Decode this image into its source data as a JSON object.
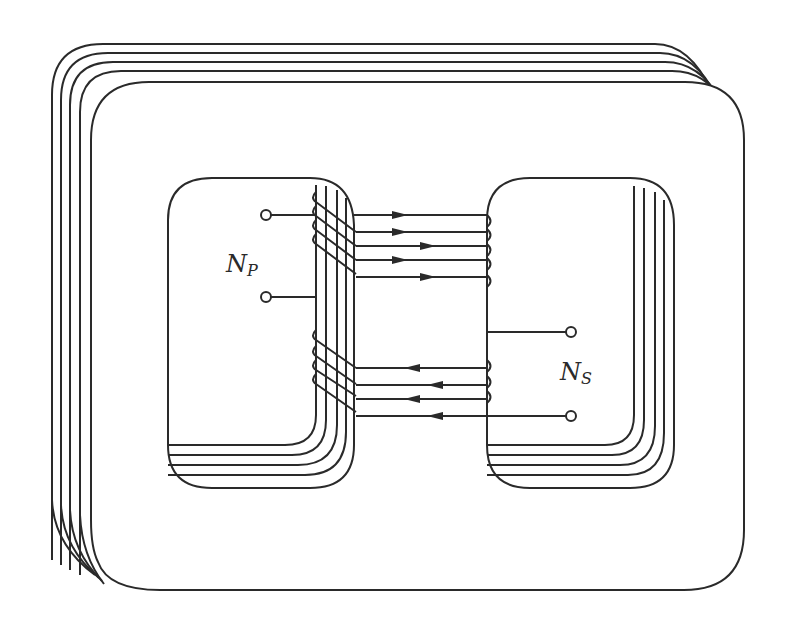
{
  "figure": {
    "type": "transformer-core-diagram",
    "stroke_color": "#2a2a2a",
    "background_color": "#ffffff"
  },
  "core": {
    "lamination_count": 5
  },
  "primary": {
    "label_main": "N",
    "label_sub": "P",
    "terminal_count": 2
  },
  "secondary": {
    "label_main": "N",
    "label_sub": "S",
    "terminal_count": 2
  },
  "flux_arrows": {
    "upper_direction": "right",
    "lower_direction": "left",
    "upper_count": 5,
    "lower_count": 4
  }
}
